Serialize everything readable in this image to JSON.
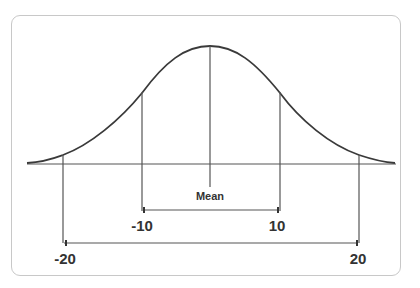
{
  "diagram": {
    "title": "",
    "type": "normal-distribution",
    "mean_label": "Mean",
    "ranges": [
      {
        "left_label": "-10",
        "right_label": "10",
        "name": "inner-range"
      },
      {
        "left_label": "-20",
        "right_label": "20",
        "name": "outer-range"
      }
    ],
    "colors": {
      "line": "#3a3a3a",
      "border": "#c8c8c8",
      "text": "#333333"
    }
  }
}
